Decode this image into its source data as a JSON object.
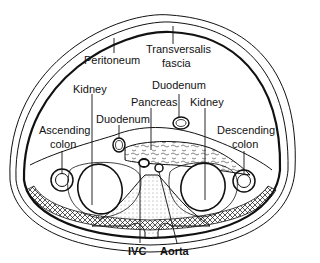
{
  "diagram": {
    "type": "anatomical cross-section (transverse abdomen, retroperitoneum)",
    "labels": {
      "peritoneum": "Peritoneum",
      "transversalis_1": "Transversalis",
      "transversalis_2": "fascia",
      "kidney_left": "Kidney",
      "duodenum_top": "Duodenum",
      "pancreas": "Pancreas",
      "kidney_right": "Kidney",
      "duodenum_left": "Duodenum",
      "ascending_1": "Ascending",
      "ascending_2": "colon",
      "descending_1": "Descending",
      "descending_2": "colon",
      "ivc": "IVC",
      "aorta": "Aorta"
    },
    "colors": {
      "line": "#111111",
      "background": "#ffffff"
    }
  }
}
